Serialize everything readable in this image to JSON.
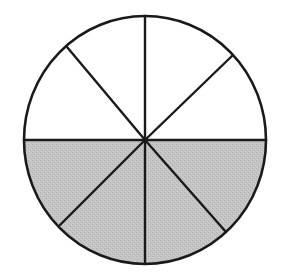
{
  "diagram": {
    "type": "fraction-circle",
    "total_parts": 8,
    "shaded_parts": 4,
    "colors": {
      "background": "#ffffff",
      "stroke": "#1a1a1a",
      "shaded_fill": "#c4c4c4",
      "unshaded_fill": "#ffffff"
    },
    "geometry": {
      "center": [
        145,
        140
      ],
      "rx": 121,
      "ry": 124,
      "spoke_endpoints": [
        [
          145,
          15
        ],
        [
          233,
          55
        ],
        [
          267,
          140
        ],
        [
          226,
          232
        ],
        [
          145,
          263
        ],
        [
          60,
          225
        ],
        [
          25,
          140
        ],
        [
          67,
          47
        ]
      ]
    }
  }
}
